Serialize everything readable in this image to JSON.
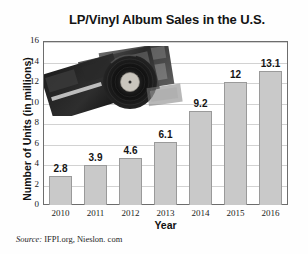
{
  "chart_data": {
    "type": "bar",
    "title": "LP/Vinyl Album Sales in the U.S.",
    "xlabel": "Year",
    "ylabel": "Number of Units (in millions)",
    "categories": [
      "2010",
      "2011",
      "2012",
      "2013",
      "2014",
      "2015",
      "2016"
    ],
    "values": [
      2.8,
      3.9,
      4.6,
      6.1,
      9.2,
      12,
      13.1
    ],
    "value_labels": [
      "2.8",
      "3.9",
      "4.6",
      "6.1",
      "9.2",
      "12",
      "13.1"
    ],
    "ylim": [
      0,
      16
    ],
    "yticks": [
      0,
      2,
      4,
      6,
      8,
      10,
      12,
      14,
      16
    ],
    "ytick_labels": [
      "0",
      "2",
      "4",
      "6",
      "8",
      "10",
      "12",
      "14",
      "16"
    ],
    "grid": true,
    "legend": null,
    "bar_color": "#c9c9c9",
    "bar_border_color": "#9a9a9a",
    "gridline_color": "#d2d2d2",
    "axis_color": "#6d6d6d"
  },
  "source": {
    "label": "Source:",
    "text": "IFPI.org, Nieslon. com"
  },
  "decoration": {
    "image_name": "vinyl-records-photo"
  }
}
